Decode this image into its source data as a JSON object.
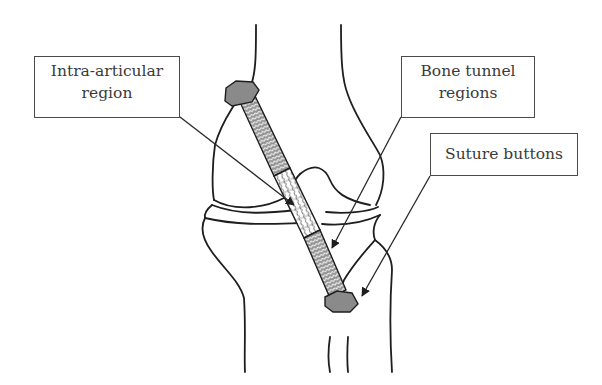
{
  "diagram": {
    "labels": {
      "intra_articular": {
        "line1": "Intra-articular",
        "line2": "region"
      },
      "bone_tunnel": {
        "line1": "Bone tunnel",
        "line2": "regions"
      },
      "suture_buttons": {
        "line1": "Suture buttons"
      }
    },
    "colors": {
      "outline": "#1e1e1e",
      "button_fill": "#8a8a8a",
      "graft_fill": "#9a9a9a",
      "graft_pattern": "#f2f2f2",
      "box_border": "#4a4a4a",
      "text": "#3a3a3a"
    }
  }
}
